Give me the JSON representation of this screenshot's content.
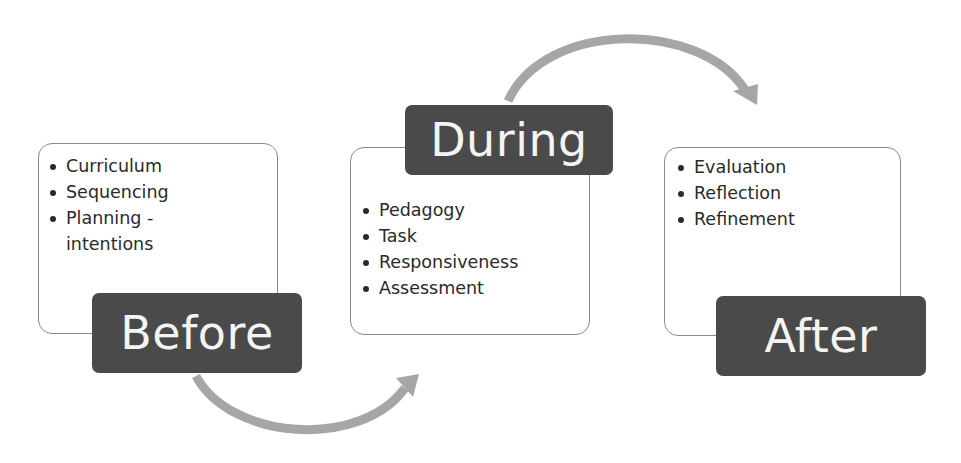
{
  "diagram": {
    "type": "process-cycle",
    "arrow_color": "#a6a6a6",
    "label_color": "#4a4a4a",
    "stages": [
      {
        "label": "Before",
        "items": [
          "Curriculum",
          "Sequencing",
          "Planning -\nintentions"
        ]
      },
      {
        "label": "During",
        "items": [
          "Pedagogy",
          "Task",
          "Responsiveness",
          "Assessment"
        ]
      },
      {
        "label": "After",
        "items": [
          "Evaluation",
          "Reflection",
          "Refinement"
        ]
      }
    ],
    "connectors": [
      {
        "from": "Before",
        "to": "During",
        "shape": "curved-arrow-below"
      },
      {
        "from": "During",
        "to": "After",
        "shape": "curved-arrow-above"
      }
    ]
  }
}
